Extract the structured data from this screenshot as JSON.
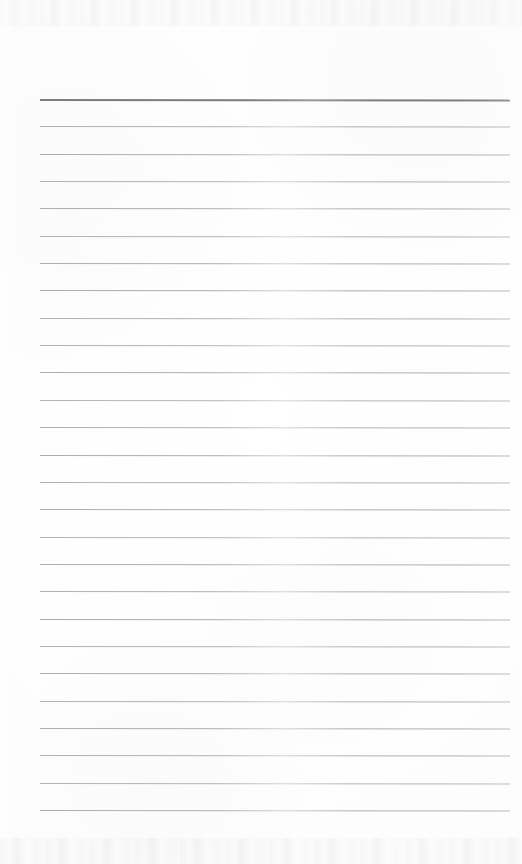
{
  "document": {
    "kind": "scanned-blank-lined-page",
    "width": 522,
    "height": 864,
    "background_color": "#fefefe",
    "text_content": "",
    "visible_text_items": []
  },
  "ruling": {
    "line_color": "#a9a9a9",
    "heavy_line_color": "#7c7c7c",
    "left_x": 40,
    "right_x": 510,
    "first_line_y": 99,
    "last_line_y": 810,
    "line_spacing": 27.35,
    "line_count": 27,
    "heavy_line_index": 0,
    "lines": [
      {
        "index": 0,
        "y": 99,
        "weight": "heavy",
        "color": "#7c7c7c",
        "opacity": 1.0
      },
      {
        "index": 1,
        "y": 126,
        "weight": "light",
        "color": "#a9a9a9",
        "opacity": 0.92
      },
      {
        "index": 2,
        "y": 154,
        "weight": "light",
        "color": "#a9a9a9",
        "opacity": 0.95
      },
      {
        "index": 3,
        "y": 181,
        "weight": "light",
        "color": "#a9a9a9",
        "opacity": 0.9
      },
      {
        "index": 4,
        "y": 208,
        "weight": "light",
        "color": "#a9a9a9",
        "opacity": 0.94
      },
      {
        "index": 5,
        "y": 236,
        "weight": "light",
        "color": "#a9a9a9",
        "opacity": 0.88
      },
      {
        "index": 6,
        "y": 263,
        "weight": "light",
        "color": "#a9a9a9",
        "opacity": 0.93
      },
      {
        "index": 7,
        "y": 290,
        "weight": "light",
        "color": "#a9a9a9",
        "opacity": 0.96
      },
      {
        "index": 8,
        "y": 318,
        "weight": "light",
        "color": "#a9a9a9",
        "opacity": 0.91
      },
      {
        "index": 9,
        "y": 345,
        "weight": "light",
        "color": "#a9a9a9",
        "opacity": 0.89
      },
      {
        "index": 10,
        "y": 372,
        "weight": "light",
        "color": "#a9a9a9",
        "opacity": 0.94
      },
      {
        "index": 11,
        "y": 400,
        "weight": "light",
        "color": "#a9a9a9",
        "opacity": 0.87
      },
      {
        "index": 12,
        "y": 427,
        "weight": "light",
        "color": "#a9a9a9",
        "opacity": 0.92
      },
      {
        "index": 13,
        "y": 455,
        "weight": "light",
        "color": "#a9a9a9",
        "opacity": 0.95
      },
      {
        "index": 14,
        "y": 482,
        "weight": "light",
        "color": "#a9a9a9",
        "opacity": 0.9
      },
      {
        "index": 15,
        "y": 509,
        "weight": "light",
        "color": "#a9a9a9",
        "opacity": 0.93
      },
      {
        "index": 16,
        "y": 537,
        "weight": "light",
        "color": "#a9a9a9",
        "opacity": 0.88
      },
      {
        "index": 17,
        "y": 564,
        "weight": "light",
        "color": "#a9a9a9",
        "opacity": 0.94
      },
      {
        "index": 18,
        "y": 591,
        "weight": "light",
        "color": "#a9a9a9",
        "opacity": 0.91
      },
      {
        "index": 19,
        "y": 619,
        "weight": "light",
        "color": "#a9a9a9",
        "opacity": 0.96
      },
      {
        "index": 20,
        "y": 646,
        "weight": "light",
        "color": "#a9a9a9",
        "opacity": 0.89
      },
      {
        "index": 21,
        "y": 673,
        "weight": "light",
        "color": "#a9a9a9",
        "opacity": 0.93
      },
      {
        "index": 22,
        "y": 701,
        "weight": "light",
        "color": "#a9a9a9",
        "opacity": 0.9
      },
      {
        "index": 23,
        "y": 728,
        "weight": "light",
        "color": "#a9a9a9",
        "opacity": 0.95
      },
      {
        "index": 24,
        "y": 755,
        "weight": "light",
        "color": "#a9a9a9",
        "opacity": 0.92
      },
      {
        "index": 25,
        "y": 783,
        "weight": "light",
        "color": "#a9a9a9",
        "opacity": 0.88
      },
      {
        "index": 26,
        "y": 810,
        "weight": "light",
        "color": "#a9a9a9",
        "opacity": 0.94
      }
    ]
  },
  "scan_artifacts": {
    "top_band": {
      "y": 0,
      "height": 26,
      "description": "faint mottled scanner noise strip"
    },
    "bottom_band": {
      "y": 838,
      "height": 26,
      "description": "faint mottled scanner noise strip"
    }
  }
}
